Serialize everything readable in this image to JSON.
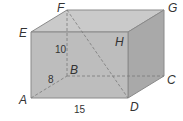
{
  "figure": {
    "type": "rectangular-prism",
    "vertices": {
      "A": {
        "label": "A",
        "x": 31,
        "y": 98
      },
      "B": {
        "label": "B",
        "x": 67,
        "y": 76
      },
      "C": {
        "label": "C",
        "x": 164,
        "y": 76
      },
      "D": {
        "label": "D",
        "x": 128,
        "y": 98
      },
      "E": {
        "label": "E",
        "x": 31,
        "y": 32
      },
      "F": {
        "label": "F",
        "x": 67,
        "y": 10
      },
      "G": {
        "label": "G",
        "x": 164,
        "y": 10
      },
      "H": {
        "label": "H",
        "x": 128,
        "y": 32
      }
    },
    "dimensions": {
      "height": "10",
      "depth": "8",
      "length": "15"
    },
    "hidden_edges": [
      "AB",
      "BC",
      "BF",
      "FD"
    ],
    "colors": {
      "front_face": "#bdbdbd",
      "top_face": "#cacaca",
      "right_face": "#a9a9a9",
      "edge": "#8a8a8a",
      "hidden_edge": "#7a7a7a",
      "label": "#333333"
    }
  }
}
